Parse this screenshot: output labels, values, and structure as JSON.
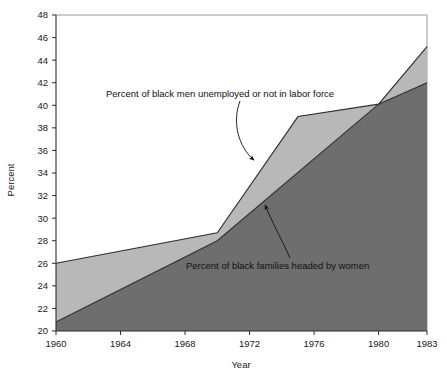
{
  "chart_data": {
    "type": "area",
    "title": "",
    "xlabel": "Year",
    "ylabel": "Percent",
    "xlim": [
      1960,
      1983
    ],
    "ylim": [
      20,
      48
    ],
    "grid": false,
    "legend_position": "inline-annotations",
    "xticks": [
      1960,
      1964,
      1968,
      1972,
      1976,
      1980,
      1983
    ],
    "yticks": [
      20,
      22,
      24,
      26,
      28,
      30,
      32,
      34,
      36,
      38,
      40,
      42,
      44,
      46,
      48
    ],
    "series": [
      {
        "name": "Percent of black men unemployed or not in labor force",
        "color": "#b8b8b8",
        "x": [
          1960,
          1970,
          1975,
          1980,
          1983
        ],
        "values": [
          26.0,
          28.7,
          39.0,
          40.1,
          45.2
        ]
      },
      {
        "name": "Percent of black families headed by women",
        "color": "#6e6e6e",
        "x": [
          1960,
          1970,
          1980,
          1983
        ],
        "values": [
          20.8,
          28.0,
          40.1,
          42.0
        ]
      }
    ],
    "annotations": [
      {
        "text": "Percent of black men unemployed or not in labor force",
        "points_to": [
          1972.4,
          34.6
        ]
      },
      {
        "text": "Percent of black families headed by women",
        "points_to": [
          1972.9,
          31.6
        ]
      }
    ]
  },
  "axes": {
    "y_title": "Percent",
    "x_title": "Year",
    "y_tick_labels": [
      "48",
      "46",
      "44",
      "42",
      "40",
      "38",
      "36",
      "34",
      "32",
      "30",
      "28",
      "26",
      "24",
      "22",
      "20"
    ],
    "x_tick_labels": [
      "1960",
      "1964",
      "1968",
      "1972",
      "1976",
      "1980",
      "1983"
    ]
  },
  "annotations": {
    "upper_label": "Percent of black men unemployed or not in labor force",
    "lower_label": "Percent of black families headed by women"
  },
  "colors": {
    "band_upper": "#b8b8b8",
    "band_lower": "#6e6e6e",
    "line": "#2f2f2f",
    "frame": "#9a9a9a",
    "text": "#111111",
    "background": "#ffffff"
  }
}
